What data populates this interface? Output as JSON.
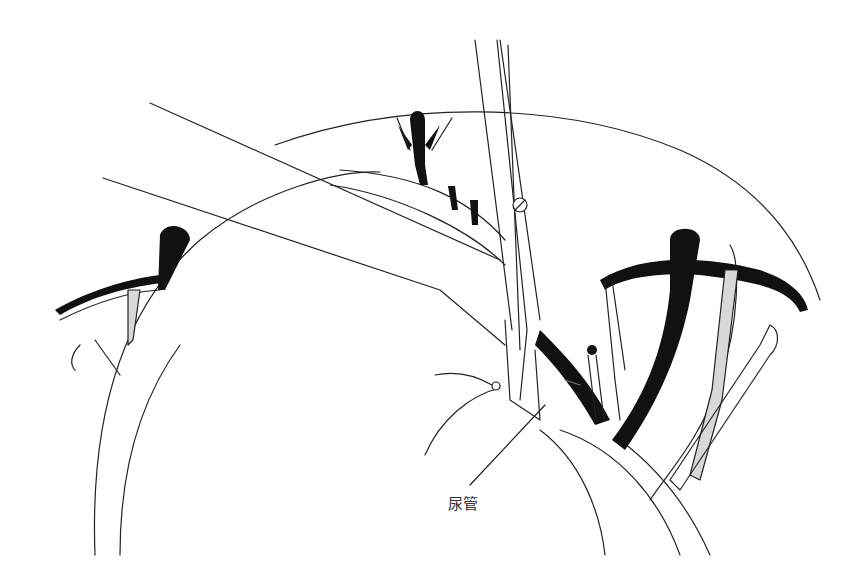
{
  "figure": {
    "type": "surgical line illustration",
    "labels": [
      {
        "id": "urethra",
        "text": "尿管",
        "x": 452,
        "y": 500
      }
    ],
    "colors": {
      "line": "#222222",
      "fill_dark": "#111111",
      "fill_gray": "#d8d8d8",
      "background": "#ffffff"
    }
  }
}
